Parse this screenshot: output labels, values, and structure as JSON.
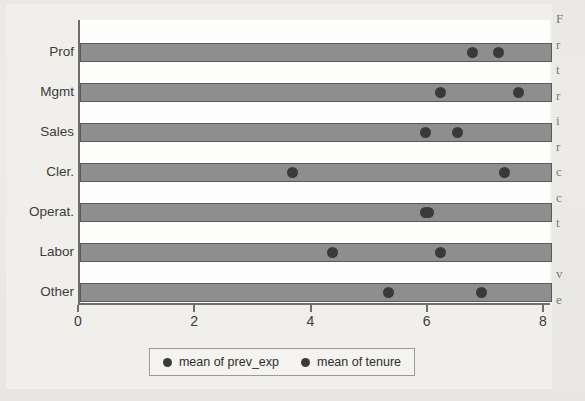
{
  "chart_data": {
    "type": "scatter",
    "title": "",
    "xlabel": "",
    "ylabel": "",
    "orientation": "horizontal",
    "categories": [
      "Prof",
      "Mgmt",
      "Sales",
      "Cler.",
      "Operat.",
      "Labor",
      "Other"
    ],
    "xlim": [
      0,
      8.12
    ],
    "xticks": [
      0,
      2,
      4,
      6,
      8
    ],
    "xtick_labels": [
      "0",
      "2",
      "4",
      "6",
      "8"
    ],
    "grid": false,
    "bar_extent": 8.12,
    "legend_position": "bottom",
    "series": [
      {
        "name": "mean of prev_exp",
        "marker": "circle",
        "color": "#3a3a3a",
        "values": [
          6.75,
          6.2,
          5.95,
          3.65,
          5.95,
          4.35,
          5.3
        ]
      },
      {
        "name": "mean of tenure",
        "marker": "circle",
        "color": "#3a3a3a",
        "values": [
          7.2,
          7.55,
          6.5,
          7.3,
          6.0,
          6.2,
          6.9
        ]
      }
    ]
  },
  "legend": {
    "entries": [
      {
        "label": "mean of prev_exp"
      },
      {
        "label": "mean of tenure"
      }
    ]
  },
  "gutter_text": {
    "lines": [
      "F",
      "r",
      "t",
      "r",
      "i",
      "r",
      "c",
      "c",
      "t",
      "",
      "v",
      "e"
    ]
  }
}
